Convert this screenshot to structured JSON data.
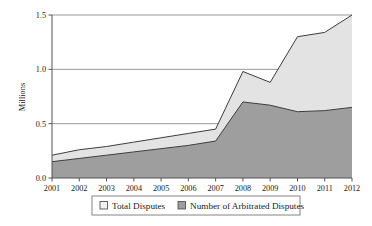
{
  "chart_data": {
    "type": "area",
    "title": "",
    "xlabel": "",
    "ylabel": "Millions",
    "categories": [
      "2001",
      "2002",
      "2003",
      "2004",
      "2005",
      "2006",
      "2007",
      "2008",
      "2009",
      "2010",
      "2011",
      "2012"
    ],
    "series": [
      {
        "name": "Total Disputes",
        "color": "#e3e3e3",
        "values": [
          0.21,
          0.26,
          0.29,
          0.33,
          0.37,
          0.41,
          0.45,
          0.98,
          0.88,
          1.3,
          1.34,
          1.5
        ]
      },
      {
        "name": "Number of Arbitrated Disputes",
        "color": "#9e9e9e",
        "values": [
          0.15,
          0.18,
          0.21,
          0.24,
          0.27,
          0.3,
          0.34,
          0.7,
          0.67,
          0.61,
          0.62,
          0.65
        ]
      }
    ],
    "ylim": [
      0.0,
      1.5
    ],
    "yticks": [
      0.0,
      0.5,
      1.0,
      1.5
    ],
    "ytick_labels": [
      "0.0",
      "0.5",
      "1.0",
      "1.5"
    ],
    "grid": true,
    "legend_position": "bottom"
  },
  "legend": {
    "items": [
      {
        "label": "Total Disputes",
        "swatch": "#f2f2f2"
      },
      {
        "label": "Number of Arbitrated Disputes",
        "swatch": "#9e9e9e"
      }
    ]
  }
}
